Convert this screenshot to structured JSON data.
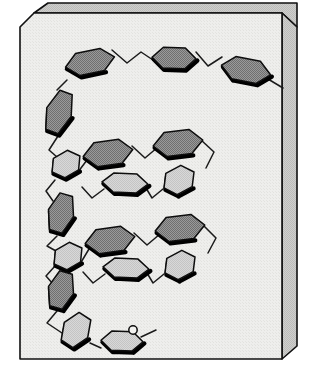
{
  "figure": {
    "kind": "molecular-structure-diagram",
    "canvas": {
      "width": 322,
      "height": 376
    },
    "background_color": "#ffffff"
  },
  "plate": {
    "name": "beveled-card",
    "face_color": "#ededeb",
    "face_texture_color": "#e2e2e0",
    "side_color": "#c9c9c7",
    "top_color": "#d6d6d4",
    "outline_color": "#111111",
    "outline_width": 1.6,
    "bevel": 14,
    "face_path": "M 34 13 L 282 13 L 282 359 L 20 359 L 20 27 Z",
    "side_path": "M 282 13 L 298 28 L 298 346 L 282 359 Z",
    "top_path": "M 34 13 L 48 2 L 298 2 L 298 28 L 282 13 Z",
    "top_path_alt": "M 34 13 L 48 2 L 297 2 L 282 13 Z",
    "bottom_shadow_path": "M 20 359 L 282 359 L 298 346"
  },
  "style": {
    "ring_dark_fill": "#8e8e8e",
    "ring_light_fill": "#d2d2d2",
    "ring_outline": "#0d0d0d",
    "ring_outline_width": 1.5,
    "ring_shadow_color": "#000000",
    "ring_shadow_width": 4.2,
    "bond_color": "#1a1a1a",
    "bond_width": 1.5,
    "atom_circle_fill": "#f2f2f0",
    "atom_circle_stroke": "#0d0d0d",
    "atom_circle_radius": 4.2
  },
  "legend": {
    "dark_ring_label": "shaded aromatic ring",
    "light_ring_label": "unshaded aromatic ring",
    "atom_label": "O",
    "chain_label": "oligomer backbone"
  },
  "chart_data": {
    "type": "diagram",
    "xlabel": "",
    "ylabel": "",
    "rings": [
      {
        "id": "r01",
        "shade": "dark",
        "cx": 90,
        "cy": 62,
        "rx": 25,
        "ry": 13,
        "rot": -12
      },
      {
        "id": "r02",
        "shade": "dark",
        "cx": 174,
        "cy": 58,
        "rx": 22,
        "ry": 12,
        "rot": 2
      },
      {
        "id": "r03",
        "shade": "dark",
        "cx": 246,
        "cy": 70,
        "rx": 25,
        "ry": 13,
        "rot": 11
      },
      {
        "id": "r04",
        "shade": "dark",
        "cx": 59,
        "cy": 112,
        "rx": 13,
        "ry": 24,
        "rot": 20
      },
      {
        "id": "r05",
        "shade": "light",
        "cx": 66,
        "cy": 164,
        "rx": 16,
        "ry": 13,
        "rot": -30
      },
      {
        "id": "r06",
        "shade": "dark",
        "cx": 108,
        "cy": 153,
        "rx": 25,
        "ry": 14,
        "rot": -8
      },
      {
        "id": "r07",
        "shade": "dark",
        "cx": 178,
        "cy": 143,
        "rx": 25,
        "ry": 14,
        "rot": -7
      },
      {
        "id": "r08",
        "shade": "light",
        "cx": 179,
        "cy": 180,
        "rx": 17,
        "ry": 14,
        "rot": -28
      },
      {
        "id": "r09",
        "shade": "light",
        "cx": 125,
        "cy": 183,
        "rx": 23,
        "ry": 11,
        "rot": 3
      },
      {
        "id": "r10",
        "shade": "dark",
        "cx": 61,
        "cy": 213,
        "rx": 13,
        "ry": 22,
        "rot": 16
      },
      {
        "id": "r11",
        "shade": "light",
        "cx": 68,
        "cy": 256,
        "rx": 16,
        "ry": 13,
        "rot": -30
      },
      {
        "id": "r12",
        "shade": "dark",
        "cx": 110,
        "cy": 240,
        "rx": 25,
        "ry": 14,
        "rot": -8
      },
      {
        "id": "r13",
        "shade": "dark",
        "cx": 180,
        "cy": 228,
        "rx": 25,
        "ry": 14,
        "rot": -7
      },
      {
        "id": "r14",
        "shade": "light",
        "cx": 180,
        "cy": 265,
        "rx": 17,
        "ry": 14,
        "rot": -28
      },
      {
        "id": "r15",
        "shade": "light",
        "cx": 126,
        "cy": 268,
        "rx": 23,
        "ry": 11,
        "rot": 3
      },
      {
        "id": "r16",
        "shade": "dark",
        "cx": 61,
        "cy": 290,
        "rx": 13,
        "ry": 21,
        "rot": 16
      },
      {
        "id": "r17",
        "shade": "light",
        "cx": 76,
        "cy": 330,
        "rx": 14,
        "ry": 19,
        "rot": 33
      },
      {
        "id": "r18",
        "shade": "light",
        "cx": 122,
        "cy": 341,
        "rx": 21,
        "ry": 11,
        "rot": 2
      }
    ],
    "bonds": [
      {
        "from": "terminus-left-top",
        "path": "M 66 80 L 57 90"
      },
      {
        "path": "M 112 50 L 126 62 L 140 52 L 152 60"
      },
      {
        "path": "M 196 53 L 207 66 L 221 58"
      },
      {
        "path": "M 269 78 L 281 86"
      },
      {
        "path": "M 58 136 L 50 150 L 56 156"
      },
      {
        "path": "M 77 172 L 86 160"
      },
      {
        "path": "M 131 146 L 144 157 L 158 147"
      },
      {
        "path": "M 201 140 L 213 152 L 206 167"
      },
      {
        "path": "M 163 188 L 152 197 L 146 187"
      },
      {
        "path": "M 105 188 L 92 197 L 82 186"
      },
      {
        "path": "M 56 180 L 47 190 L 52 200"
      },
      {
        "path": "M 57 236 L 48 245 L 55 250"
      },
      {
        "path": "M 79 264 L 88 249"
      },
      {
        "path": "M 133 233 L 146 244 L 159 234"
      },
      {
        "path": "M 203 226 L 215 238 L 207 252"
      },
      {
        "path": "M 164 273 L 153 282 L 147 272"
      },
      {
        "path": "M 106 273 L 93 282 L 83 271"
      },
      {
        "path": "M 56 264 L 47 274 L 52 282"
      },
      {
        "path": "M 57 312 L 48 323 L 61 332"
      },
      {
        "path": "M 90 342 L 100 347"
      },
      {
        "from": "terminus-right-bottom",
        "path": "M 142 336 L 155 329"
      }
    ],
    "atoms": [
      {
        "id": "a1",
        "label": "O",
        "cx": 133,
        "cy": 330
      }
    ],
    "legend_entries": [
      {
        "name": "shaded aromatic ring",
        "color": "#8e8e8e"
      },
      {
        "name": "unshaded aromatic ring",
        "color": "#d2d2d2"
      },
      {
        "name": "oligomer backbone",
        "color": "#1a1a1a"
      }
    ],
    "counts": {
      "rings_total": 18,
      "rings_dark": 9,
      "rings_light": 9,
      "atoms_labeled": 1
    }
  }
}
